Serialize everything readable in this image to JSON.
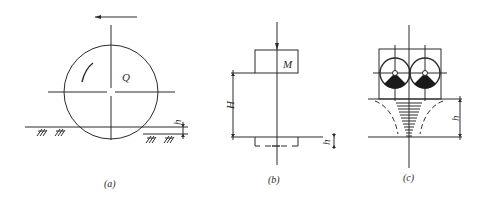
{
  "figure": {
    "panels": [
      {
        "id": "a",
        "caption": "(a)",
        "labels": {
          "center_label": "Q",
          "depth_label": "h"
        },
        "elements": [
          "rolling drum (circle)",
          "direction arrow pointing left",
          "rotation arc",
          "ground line with hatching",
          "sinkage dimension h"
        ]
      },
      {
        "id": "b",
        "caption": "(b)",
        "labels": {
          "mass_label": "M",
          "drop_height_label": "H",
          "depth_label": "h"
        },
        "elements": [
          "falling mass box",
          "drop height dimension H",
          "ground line",
          "dashed footprint",
          "depth dimension h"
        ]
      },
      {
        "id": "c",
        "caption": "(c)",
        "labels": {
          "depth_label": "h"
        },
        "elements": [
          "frame with two eccentric vibrators",
          "compaction cone (hatched funnel)",
          "dashed influence curves",
          "depth dimension h"
        ]
      }
    ]
  },
  "colors": {
    "ink": "#2a2a2a",
    "background": "#ffffff"
  }
}
